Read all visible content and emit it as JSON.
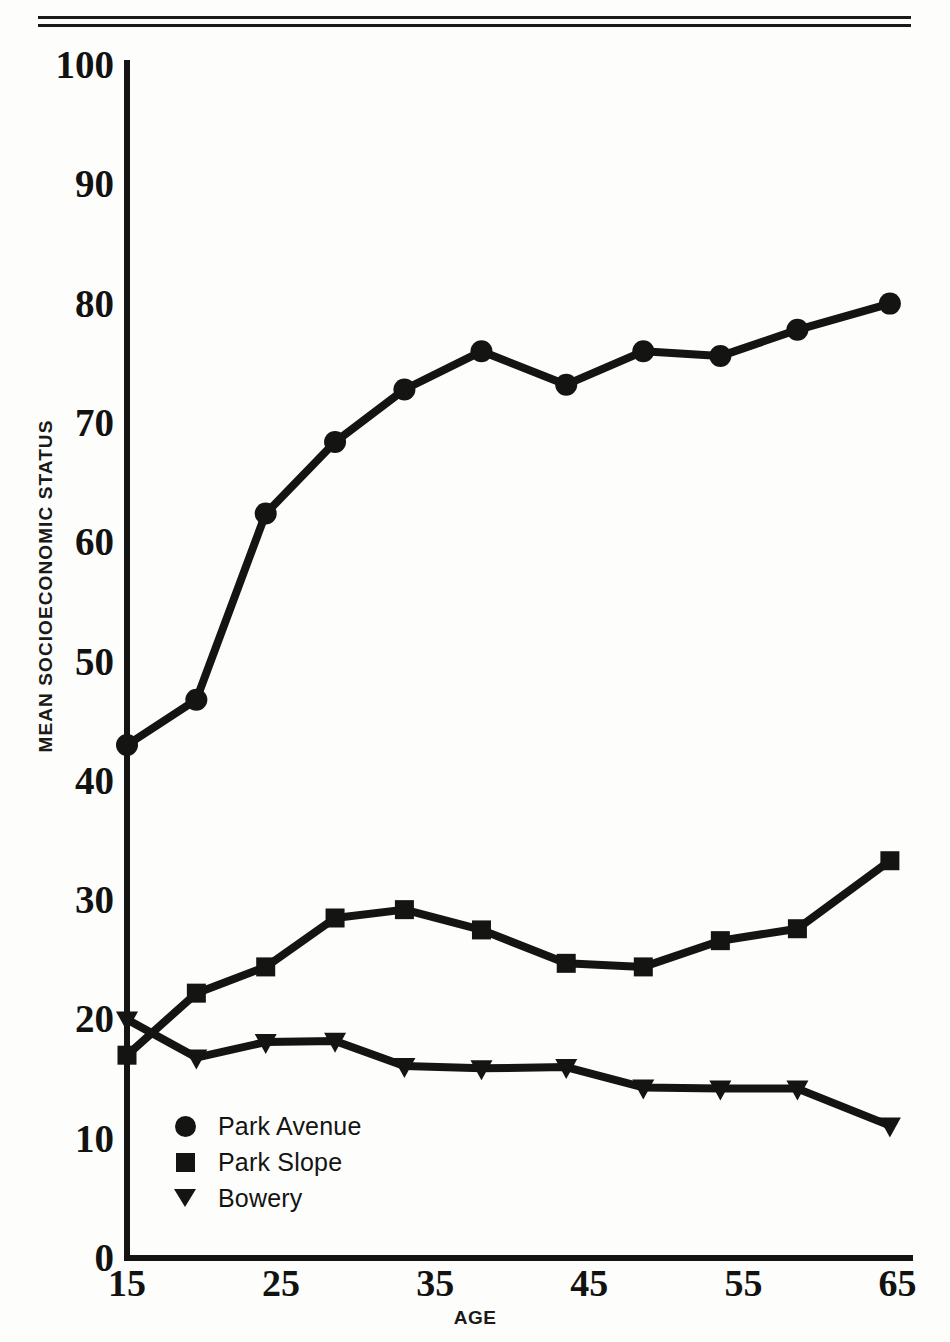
{
  "figure": {
    "yaxis_title": "MEAN SOCIOECONOMIC STATUS",
    "xaxis_title": "AGE"
  },
  "legend": {
    "items": [
      {
        "label": "Park Avenue",
        "marker": "circle-marker-icon"
      },
      {
        "label": "Park Slope",
        "marker": "square-marker-icon"
      },
      {
        "label": "Bowery",
        "marker": "triangle-down-marker-icon"
      }
    ]
  },
  "axes": {
    "y_ticks": [
      "0",
      "10",
      "20",
      "30",
      "40",
      "50",
      "60",
      "70",
      "80",
      "90",
      "100"
    ],
    "x_ticks": [
      "15",
      "25",
      "35",
      "45",
      "55",
      "65"
    ]
  },
  "chart_data": {
    "type": "line",
    "title": "",
    "xlabel": "AGE",
    "ylabel": "MEAN SOCIOECONOMIC STATUS",
    "xlim": [
      15,
      66
    ],
    "ylim": [
      0,
      100
    ],
    "grid": false,
    "legend_position": "lower-left-inside",
    "x": [
      15,
      19.5,
      24,
      28.5,
      33,
      38,
      43.5,
      48.5,
      53.5,
      58.5,
      64.5
    ],
    "series": [
      {
        "name": "Park Avenue",
        "marker": "circle",
        "color": "#141412",
        "x": [
          15,
          19.5,
          24,
          28.5,
          33,
          38,
          43.5,
          48.5,
          53.5,
          58.5,
          64.5
        ],
        "values": [
          43,
          46.8,
          62.4,
          68.4,
          72.8,
          76,
          73.2,
          76,
          75.6,
          77.8,
          80
        ]
      },
      {
        "name": "Park Slope",
        "marker": "square",
        "color": "#141412",
        "x": [
          15,
          19.5,
          24,
          28.5,
          33,
          38,
          43.5,
          48.5,
          53.5,
          58.5,
          64.5
        ],
        "values": [
          17,
          22.2,
          24.4,
          28.5,
          29.2,
          27.5,
          24.7,
          24.4,
          26.6,
          27.6,
          33.3
        ]
      },
      {
        "name": "Bowery",
        "marker": "triangle-down",
        "color": "#141412",
        "x": [
          15,
          19.5,
          24,
          28.5,
          33,
          38,
          43.5,
          48.5,
          53.5,
          58.5,
          64.5
        ],
        "values": [
          20,
          16.8,
          18.1,
          18.2,
          16.1,
          15.9,
          16.0,
          14.3,
          14.2,
          14.2,
          11.1
        ]
      }
    ]
  }
}
